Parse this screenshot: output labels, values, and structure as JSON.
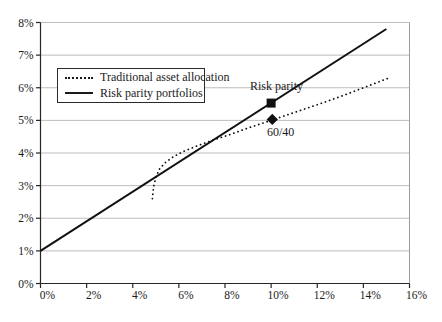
{
  "chart_data": {
    "type": "line",
    "title": "",
    "xlabel": "",
    "ylabel": "",
    "xlim": [
      0,
      16
    ],
    "ylim": [
      0,
      8
    ],
    "x_tick_values": [
      0,
      2,
      4,
      6,
      8,
      10,
      12,
      14,
      16
    ],
    "x_tick_labels": [
      "0%",
      "2%",
      "4%",
      "6%",
      "8%",
      "10%",
      "12%",
      "14%",
      "16%"
    ],
    "y_tick_values": [
      0,
      1,
      2,
      3,
      4,
      5,
      6,
      7,
      8
    ],
    "y_tick_labels": [
      "0%",
      "1%",
      "2%",
      "3%",
      "4%",
      "5%",
      "6%",
      "7%",
      "8%"
    ],
    "grid": "horizontal",
    "legend_position": "upper-left-inside",
    "colors": {
      "series": "#111111",
      "gridline": "#bdbdbd",
      "border": "#9a9a9a",
      "axis": "#262626"
    },
    "series": [
      {
        "name": "Traditional asset allocation",
        "style": "dotted",
        "points": [
          [
            4.85,
            2.6
          ],
          [
            4.9,
            2.95
          ],
          [
            5.0,
            3.25
          ],
          [
            5.15,
            3.5
          ],
          [
            5.4,
            3.7
          ],
          [
            5.75,
            3.88
          ],
          [
            6.2,
            4.05
          ],
          [
            6.8,
            4.22
          ],
          [
            7.5,
            4.4
          ],
          [
            8.2,
            4.56
          ],
          [
            9.1,
            4.79
          ],
          [
            10,
            5.0
          ],
          [
            11,
            5.24
          ],
          [
            12,
            5.48
          ],
          [
            13,
            5.73
          ],
          [
            14,
            6.0
          ],
          [
            15.1,
            6.3
          ]
        ]
      },
      {
        "name": "Risk parity portfolios",
        "style": "solid",
        "points": [
          [
            0,
            1
          ],
          [
            15,
            7.8
          ]
        ]
      }
    ],
    "markers": [
      {
        "label": "Risk parity",
        "shape": "square",
        "x": 10.0,
        "y": 5.53
      },
      {
        "label": "60/40",
        "shape": "diamond",
        "x": 10.05,
        "y": 5.03
      }
    ]
  }
}
